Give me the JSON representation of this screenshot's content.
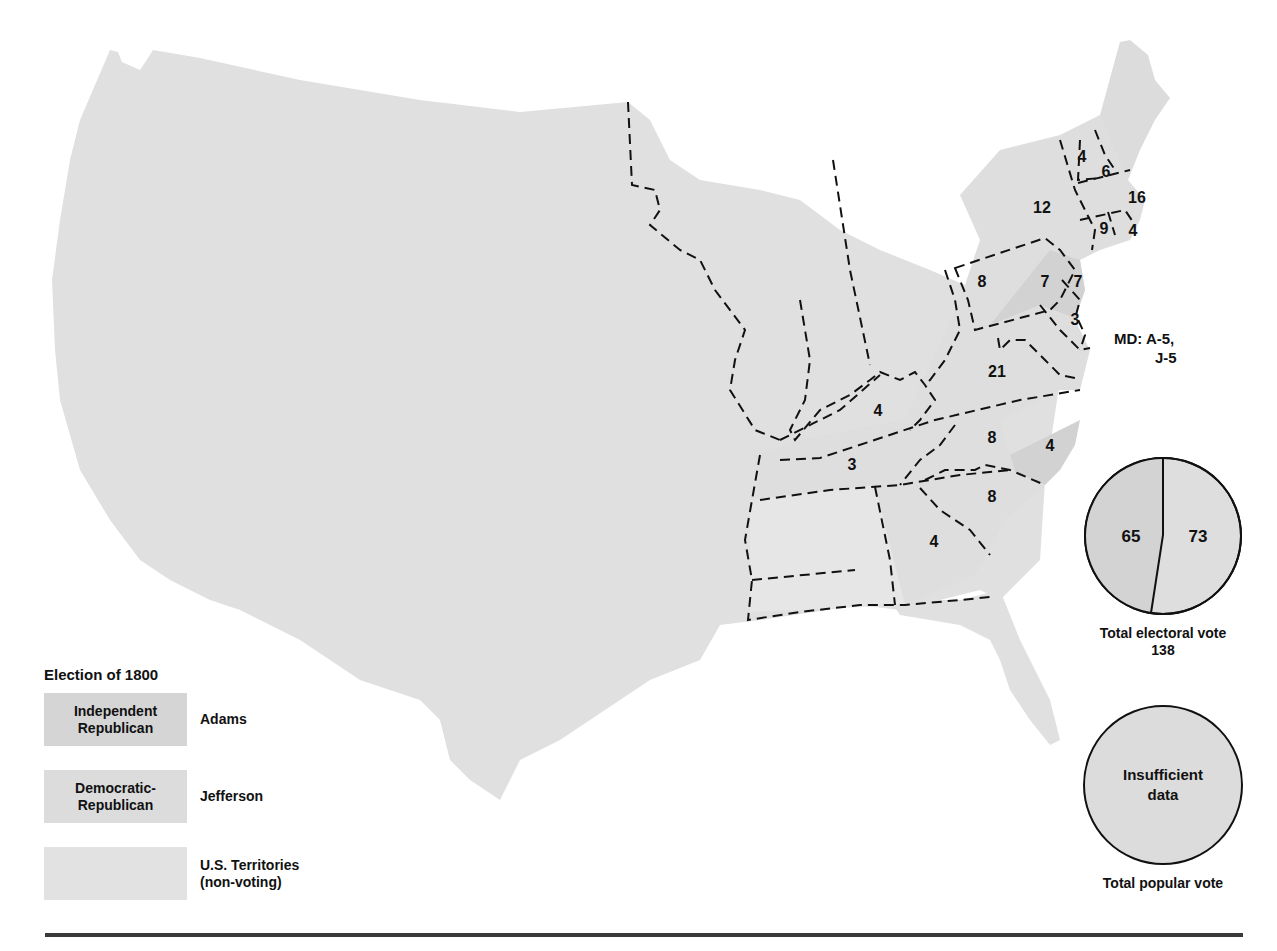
{
  "title": "Election of 1800",
  "colors": {
    "adams": "#d5d5d5",
    "jefferson": "#dedede",
    "territories": "#e4e4e4",
    "borders": "#111111",
    "rule": "#3a3a3a"
  },
  "legend": {
    "title": "Election of 1800",
    "items": [
      {
        "swatch_label": "Independent Republican",
        "swatch_line1": "Independent",
        "swatch_line2": "Republican",
        "candidate": "Adams"
      },
      {
        "swatch_label": "Democratic-Republican",
        "swatch_line1": "Democratic-",
        "swatch_line2": "Republican",
        "candidate": "Jefferson"
      },
      {
        "swatch_label": "",
        "candidate_line1": "U.S. Territories",
        "candidate_line2": "(non-voting)"
      }
    ]
  },
  "states": [
    {
      "name": "Vermont",
      "electoral_votes": "4"
    },
    {
      "name": "New Hampshire",
      "electoral_votes": "6"
    },
    {
      "name": "Massachusetts",
      "electoral_votes": "16"
    },
    {
      "name": "New York",
      "electoral_votes": "12"
    },
    {
      "name": "Connecticut",
      "electoral_votes": "9"
    },
    {
      "name": "Rhode Island",
      "electoral_votes": "4"
    },
    {
      "name": "Pennsylvania (Jefferson)",
      "electoral_votes": "8"
    },
    {
      "name": "Pennsylvania (Adams)",
      "electoral_votes": "7"
    },
    {
      "name": "New Jersey",
      "electoral_votes": "7"
    },
    {
      "name": "Delaware",
      "electoral_votes": "3"
    },
    {
      "name": "Virginia",
      "electoral_votes": "21"
    },
    {
      "name": "Kentucky",
      "electoral_votes": "4"
    },
    {
      "name": "Tennessee",
      "electoral_votes": "3"
    },
    {
      "name": "North Carolina (Jefferson)",
      "electoral_votes": "8"
    },
    {
      "name": "North Carolina (Adams)",
      "electoral_votes": "4"
    },
    {
      "name": "South Carolina",
      "electoral_votes": "8"
    },
    {
      "name": "Georgia",
      "electoral_votes": "4"
    }
  ],
  "md_note": {
    "line1": "MD:  A-5,",
    "line2": "J-5"
  },
  "electoral_pie": {
    "left_value": "65",
    "right_value": "73",
    "caption_line1": "Total electoral vote",
    "caption_line2": "138"
  },
  "popular_pie": {
    "center_line1": "Insufficient",
    "center_line2": "data",
    "caption": "Total popular vote"
  }
}
